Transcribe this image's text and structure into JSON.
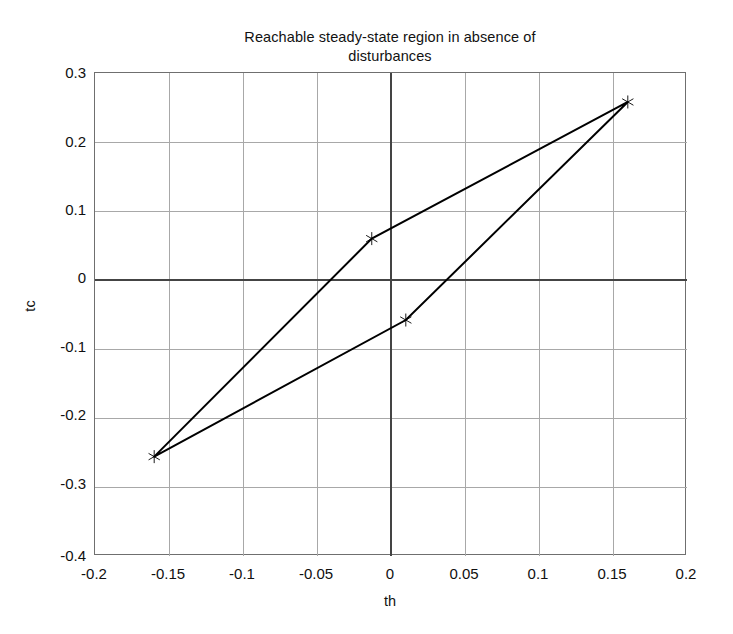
{
  "chart_data": {
    "type": "line",
    "title": "Reachable steady-state region in absence of\ndisturbances",
    "xlabel": "th",
    "ylabel": "tc",
    "xlim": [
      -0.2,
      0.2
    ],
    "ylim": [
      -0.4,
      0.3
    ],
    "grid": true,
    "legend": "none",
    "xticks": [
      "-0.2",
      "-0.15",
      "-0.1",
      "-0.05",
      "0",
      "0.05",
      "0.1",
      "0.15",
      "0.2"
    ],
    "xtick_values": [
      -0.2,
      -0.15,
      -0.1,
      -0.05,
      0,
      0.05,
      0.1,
      0.15,
      0.2
    ],
    "yticks": [
      "0.3",
      "0.2",
      "0.1",
      "0",
      "-0.1",
      "-0.2",
      "-0.3",
      "-0.4"
    ],
    "ytick_values": [
      0.3,
      0.2,
      0.1,
      0,
      -0.1,
      -0.2,
      -0.3,
      -0.4
    ],
    "series": [
      {
        "name": "reachable-region-boundary",
        "marker": "star",
        "color": "#000000",
        "linewidth": 2,
        "closed": true,
        "x": [
          -0.16,
          -0.013,
          0.16,
          0.01,
          -0.16
        ],
        "y": [
          -0.256,
          0.06,
          0.258,
          -0.058,
          -0.256
        ]
      }
    ],
    "vertices": [
      {
        "label": "bottom-left-vertex",
        "x": -0.16,
        "y": -0.256
      },
      {
        "label": "upper-middle-vertex",
        "x": -0.013,
        "y": 0.06
      },
      {
        "label": "top-right-vertex",
        "x": 0.16,
        "y": 0.258
      },
      {
        "label": "lower-middle-vertex",
        "x": 0.01,
        "y": -0.058
      }
    ],
    "colors": {
      "line": "#000000",
      "grid": "#a8a8a8",
      "axis_zero": "#444444",
      "box": "#6f6f6f",
      "background": "#ffffff",
      "text": "#101010"
    }
  }
}
